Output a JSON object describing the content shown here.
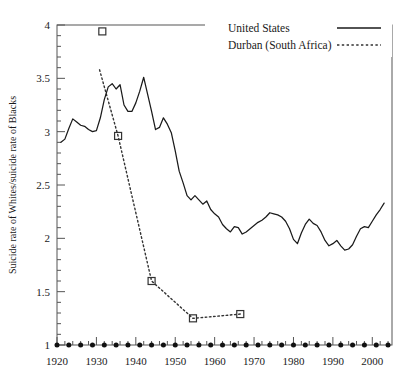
{
  "chart_data": {
    "type": "line",
    "title": "",
    "xlabel": "",
    "ylabel": "Suicide rate of Whites/suicide rate of Blacks",
    "xlim": [
      1920,
      2005
    ],
    "ylim": [
      1,
      4
    ],
    "xticks": [
      1920,
      1930,
      1940,
      1950,
      1960,
      1970,
      1980,
      1990,
      2000
    ],
    "xtick_labels": [
      "1920",
      "1930",
      "1940",
      "1950",
      "1960",
      "1970",
      "1980",
      "1990",
      "2000"
    ],
    "yticks": [
      1,
      1.5,
      2,
      2.5,
      3,
      3.5,
      4
    ],
    "ytick_labels": [
      "1",
      "1.5",
      "2",
      "2.5",
      "3",
      "3.5",
      "4"
    ],
    "minor_tick_interval_x": 2,
    "minor_tick_interval_y": 0.1,
    "grid": false,
    "legend_position": "top-right",
    "legend": [
      {
        "name": "United States",
        "style": "solid"
      },
      {
        "name": "Durban (South Africa)",
        "style": "dotted"
      }
    ],
    "series": [
      {
        "name": "United States",
        "style": "solid",
        "color": "#1a1a1a",
        "points": [
          [
            1921.0,
            2.9
          ],
          [
            1922.0,
            2.93
          ],
          [
            1923.0,
            3.03
          ],
          [
            1924.0,
            3.12
          ],
          [
            1925.0,
            3.09
          ],
          [
            1926.0,
            3.06
          ],
          [
            1927.0,
            3.05
          ],
          [
            1928.0,
            3.02
          ],
          [
            1929.0,
            3.0
          ],
          [
            1930.0,
            3.01
          ],
          [
            1931.0,
            3.13
          ],
          [
            1932.0,
            3.3
          ],
          [
            1933.0,
            3.42
          ],
          [
            1934.0,
            3.45
          ],
          [
            1935.0,
            3.4
          ],
          [
            1936.0,
            3.44
          ],
          [
            1937.0,
            3.25
          ],
          [
            1938.0,
            3.19
          ],
          [
            1939.0,
            3.19
          ],
          [
            1940.0,
            3.27
          ],
          [
            1941.0,
            3.38
          ],
          [
            1942.0,
            3.51
          ],
          [
            1943.0,
            3.35
          ],
          [
            1944.0,
            3.19
          ],
          [
            1945.0,
            3.02
          ],
          [
            1946.0,
            3.04
          ],
          [
            1947.0,
            3.13
          ],
          [
            1948.0,
            3.07
          ],
          [
            1949.0,
            2.99
          ],
          [
            1950.0,
            2.82
          ],
          [
            1951.0,
            2.63
          ],
          [
            1952.0,
            2.52
          ],
          [
            1953.0,
            2.4
          ],
          [
            1954.0,
            2.36
          ],
          [
            1955.0,
            2.4
          ],
          [
            1956.0,
            2.36
          ],
          [
            1957.0,
            2.32
          ],
          [
            1958.0,
            2.35
          ],
          [
            1959.0,
            2.27
          ],
          [
            1960.0,
            2.23
          ],
          [
            1961.0,
            2.2
          ],
          [
            1962.0,
            2.13
          ],
          [
            1963.0,
            2.09
          ],
          [
            1964.0,
            2.06
          ],
          [
            1965.0,
            2.11
          ],
          [
            1966.0,
            2.1
          ],
          [
            1967.0,
            2.04
          ],
          [
            1968.0,
            2.06
          ],
          [
            1969.0,
            2.09
          ],
          [
            1970.0,
            2.12
          ],
          [
            1971.0,
            2.15
          ],
          [
            1972.0,
            2.17
          ],
          [
            1973.0,
            2.2
          ],
          [
            1974.0,
            2.24
          ],
          [
            1975.0,
            2.23
          ],
          [
            1976.0,
            2.22
          ],
          [
            1977.0,
            2.2
          ],
          [
            1978.0,
            2.16
          ],
          [
            1979.0,
            2.09
          ],
          [
            1980.0,
            1.99
          ],
          [
            1981.0,
            1.95
          ],
          [
            1982.0,
            2.05
          ],
          [
            1983.0,
            2.13
          ],
          [
            1984.0,
            2.18
          ],
          [
            1985.0,
            2.14
          ],
          [
            1986.0,
            2.12
          ],
          [
            1987.0,
            2.06
          ],
          [
            1988.0,
            1.98
          ],
          [
            1989.0,
            1.93
          ],
          [
            1990.0,
            1.95
          ],
          [
            1991.0,
            1.98
          ],
          [
            1992.0,
            1.93
          ],
          [
            1993.0,
            1.89
          ],
          [
            1994.0,
            1.9
          ],
          [
            1995.0,
            1.94
          ],
          [
            1996.0,
            2.02
          ],
          [
            1997.0,
            2.09
          ],
          [
            1998.0,
            2.11
          ],
          [
            1999.0,
            2.1
          ],
          [
            2000.0,
            2.16
          ],
          [
            2001.0,
            2.22
          ],
          [
            2002.0,
            2.27
          ],
          [
            2003.0,
            2.33
          ]
        ]
      },
      {
        "name": "Durban (South Africa)",
        "style": "dotted",
        "color": "#333333",
        "marker": "open-square",
        "line_points": [
          [
            1930.8,
            3.58
          ],
          [
            1935.5,
            2.96
          ],
          [
            1944.0,
            1.6
          ],
          [
            1954.5,
            1.25
          ],
          [
            1966.5,
            1.29
          ]
        ],
        "marker_points": [
          [
            1931.5,
            3.94
          ],
          [
            1935.5,
            2.96
          ],
          [
            1944.0,
            1.6
          ],
          [
            1954.5,
            1.25
          ],
          [
            1966.5,
            1.29
          ]
        ]
      },
      {
        "name": "reference-line",
        "style": "dotted-circles",
        "color": "#111111",
        "marker": "filled-circle",
        "value": 1.0,
        "x_start": 1920,
        "x_end": 2005,
        "x_step": 3
      }
    ]
  },
  "legend": {
    "united_states": "United States",
    "durban": "Durban (South Africa)"
  },
  "axes": {
    "y_title": "Suicide rate of Whites/suicide rate of Blacks"
  }
}
